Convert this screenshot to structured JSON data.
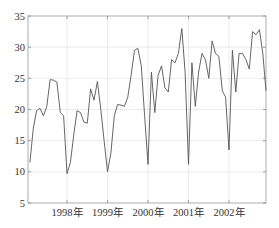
{
  "chart_data": {
    "type": "line",
    "title": "",
    "xlabel": "",
    "ylabel": "",
    "ylim": [
      5,
      35
    ],
    "yticks": [
      5,
      10,
      15,
      20,
      25,
      30,
      35
    ],
    "xtick_labels": [
      "1998年",
      "1999年",
      "2000年",
      "2001年",
      "2002年"
    ],
    "grid": true,
    "legend": null,
    "series": [
      {
        "name": "series",
        "color": "#555555",
        "x_start_month_index": 0,
        "values": [
          10.0,
          11.5,
          17.0,
          19.8,
          20.2,
          19.0,
          20.5,
          24.8,
          24.7,
          24.4,
          19.5,
          19.0,
          9.7,
          11.5,
          16.0,
          19.8,
          19.5,
          18.0,
          17.8,
          23.3,
          21.5,
          24.5,
          20.0,
          15.0,
          10.0,
          13.0,
          19.0,
          20.8,
          20.7,
          20.5,
          22.0,
          25.5,
          29.5,
          29.8,
          27.0,
          19.0,
          11.2,
          26.0,
          19.5,
          25.5,
          27.0,
          23.5,
          22.8,
          28.0,
          27.5,
          29.0,
          33.0,
          26.0,
          11.2,
          27.5,
          20.5,
          26.0,
          29.0,
          28.0,
          25.0,
          31.0,
          29.0,
          28.5,
          23.0,
          22.0,
          13.5,
          29.5,
          22.8,
          29.0,
          29.0,
          28.0,
          26.5,
          32.5,
          32.0,
          32.8,
          29.0,
          23.0
        ]
      }
    ]
  },
  "colors": {
    "axis": "#888888",
    "grid": "#e6e6e6",
    "line": "#555555",
    "text": "#333333"
  }
}
